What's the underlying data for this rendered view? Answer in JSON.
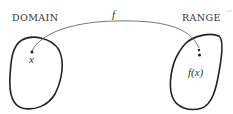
{
  "diagram": {
    "type": "function-mapping",
    "domain": {
      "title": "Domain",
      "title_display": "DOMAIN",
      "element_label": "x"
    },
    "range": {
      "title": "Range",
      "title_display": "RANGE",
      "element_label": "f(x)"
    },
    "mapping": {
      "label": "f",
      "from": "x",
      "to": "f(x)"
    },
    "colors": {
      "outline": "#222222",
      "arrow": "#666666",
      "text": "#333333",
      "background": "#ffffff"
    }
  }
}
